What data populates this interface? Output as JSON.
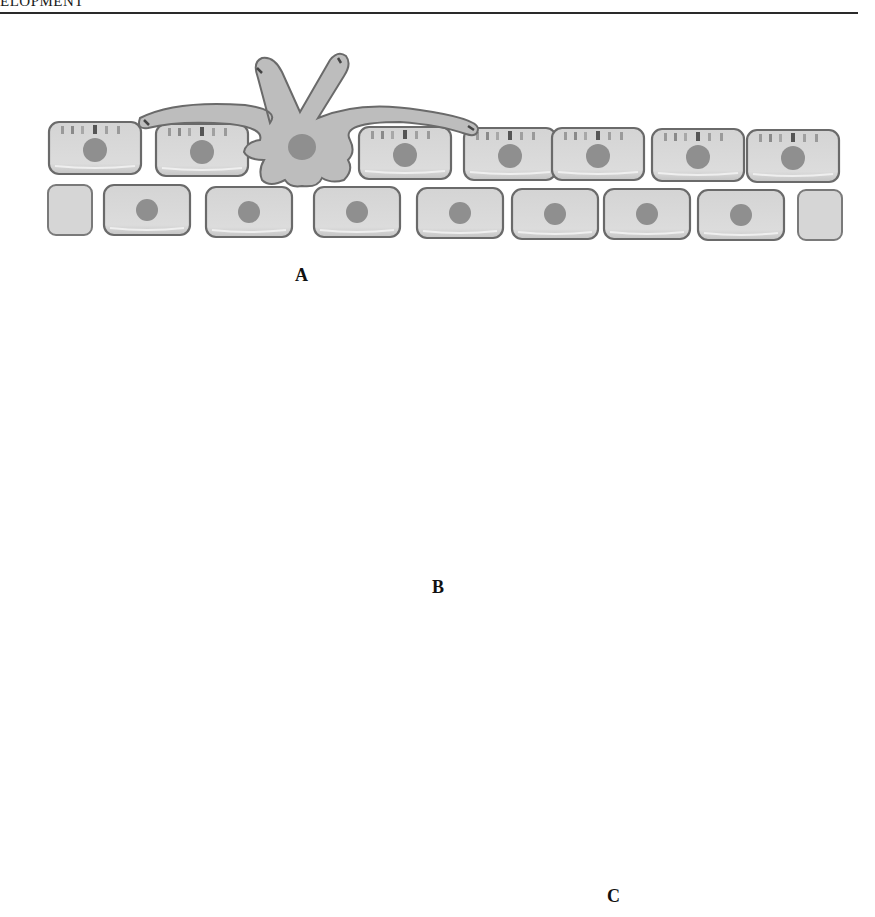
{
  "header": {
    "running_head": "ELOPMENT"
  },
  "panels": [
    {
      "id": "A",
      "label": "A",
      "description": "Cell extends long processes across epithelial surface, anchored on top layer"
    },
    {
      "id": "B",
      "label": "B",
      "description": "Cell migrates (large curved arrow); small arrows show retraction/extension of processes"
    },
    {
      "id": "C",
      "label": "C",
      "description": "Cell continues moving in direction of arrow across the epithelium, leaving a gap"
    }
  ],
  "colors": {
    "cell_fill": "#d9d9d9",
    "cell_stroke": "#6a6a6a",
    "nucleus": "#8f8f8f",
    "migrating_cell_fill": "#bdbdbd",
    "arrow": "#2a2a2a",
    "background": "#ffffff"
  }
}
